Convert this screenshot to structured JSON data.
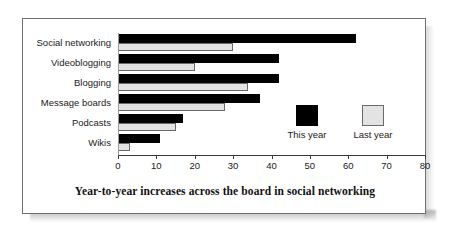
{
  "caption": "Year-to-year increases across the board in social networking",
  "legend": {
    "items": [
      {
        "label": "This year",
        "color": "#000000",
        "swatch": "black"
      },
      {
        "label": "Last year",
        "color": "#e3e3e3",
        "swatch": "gray"
      }
    ]
  },
  "axis": {
    "ticks": [
      "0",
      "10",
      "20",
      "30",
      "40",
      "50",
      "60",
      "70",
      "80"
    ]
  },
  "chart_data": {
    "type": "bar",
    "orientation": "horizontal",
    "title": "Year-to-year increases across the board in social networking",
    "xlabel": "",
    "ylabel": "",
    "xlim": [
      0,
      80
    ],
    "xticks": [
      0,
      10,
      20,
      30,
      40,
      50,
      60,
      70,
      80
    ],
    "grid": false,
    "legend_position": "inside-right",
    "categories": [
      "Social networking",
      "Videoblogging",
      "Blogging",
      "Message boards",
      "Podcasts",
      "Wikis"
    ],
    "series": [
      {
        "name": "This year",
        "color": "#000000",
        "values": [
          62,
          42,
          42,
          37,
          17,
          11
        ]
      },
      {
        "name": "Last year",
        "color": "#e3e3e3",
        "values": [
          30,
          20,
          34,
          28,
          15,
          3
        ]
      }
    ]
  }
}
